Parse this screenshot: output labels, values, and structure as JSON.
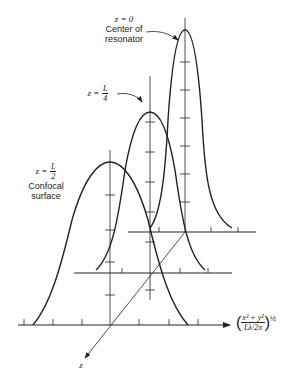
{
  "labels": {
    "z0": {
      "eq": "z = 0",
      "line1": "Center of",
      "line2": "resonator"
    },
    "zL4": {
      "prefix": "z =",
      "num": "L",
      "den": "4"
    },
    "zL2": {
      "prefix": "z =",
      "num": "L",
      "den": "2",
      "line1": "Confocal",
      "line2": "surface"
    },
    "x_axis": {
      "num": "x² + y²",
      "den": "Lλ/2π",
      "exp": "½"
    },
    "z_axis": "z"
  },
  "colors": {
    "ink": "#222222",
    "background": "#ffffff"
  },
  "planes": [
    {
      "name": "z=0",
      "baseline_y": 232,
      "center_x": 185,
      "peak_y": 30
    },
    {
      "name": "z=L/4",
      "baseline_y": 273,
      "center_x": 150,
      "peak_y": 112
    },
    {
      "name": "z=L/2",
      "baseline_y": 325,
      "center_x": 110,
      "peak_y": 162
    }
  ]
}
